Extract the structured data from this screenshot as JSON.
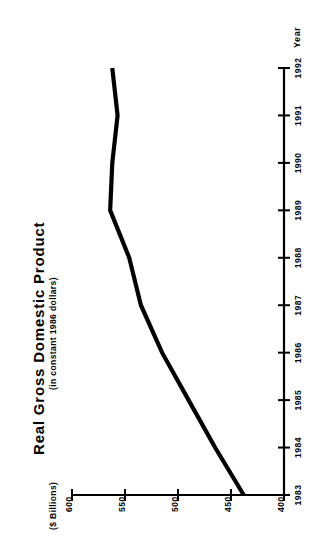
{
  "chart_data": {
    "type": "line",
    "title": "Real Gross Domestic Product",
    "subtitle": "(in constant 1986 dollars)",
    "xlabel": "Year",
    "ylabel": "($ Billions)",
    "orientation": "rotated-90-ccw",
    "grid": false,
    "legend": null,
    "categories": [
      "1983",
      "1984",
      "1985",
      "1986",
      "1987",
      "1988",
      "1989",
      "1990",
      "1991",
      "1992"
    ],
    "x": [
      1983,
      1984,
      1985,
      1986,
      1987,
      1988,
      1989,
      1990,
      1991,
      1992
    ],
    "values": [
      438,
      465,
      490,
      515,
      535,
      546,
      564,
      562,
      557,
      562
    ],
    "ylim": [
      400,
      600
    ],
    "y_ticks": [
      "600",
      "550",
      "500",
      "450",
      "400"
    ],
    "y_tick_values": [
      600,
      550,
      500,
      450,
      400
    ],
    "x_ticks": [
      "1983",
      "1984",
      "1985",
      "1986",
      "1987",
      "1988",
      "1989",
      "1990",
      "1991",
      "1992"
    ],
    "series": [
      {
        "name": "Real Gross Domestic Product",
        "color": "#000000",
        "values": [
          438,
          465,
          490,
          515,
          535,
          546,
          564,
          562,
          557,
          562
        ]
      }
    ]
  },
  "axes": {
    "value_axis_name": "value-axis",
    "category_axis_name": "year-axis"
  }
}
